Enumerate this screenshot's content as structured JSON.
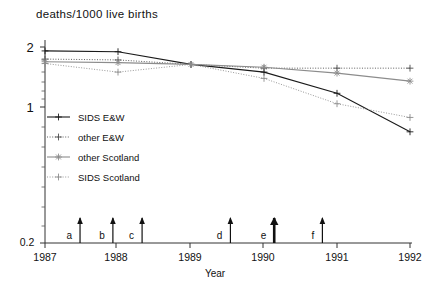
{
  "chart_data": {
    "type": "line",
    "title": "deaths/1000 live births",
    "xlabel": "Year",
    "ylabel": "",
    "yscale": "log",
    "ylim": [
      0.2,
      2.4
    ],
    "xlim": [
      1987,
      1992
    ],
    "ytick_labels": [
      "2",
      "1",
      "0.2"
    ],
    "ytick_values": [
      2,
      1,
      0.2
    ],
    "xtick_labels": [
      "1987",
      "1988",
      "1989",
      "1990",
      "1991",
      "1992"
    ],
    "xtick_values": [
      1987,
      1988,
      1989,
      1990,
      1991,
      1992
    ],
    "grid": false,
    "legend_position": "center-left",
    "x": [
      1987,
      1988,
      1989,
      1990,
      1991,
      1992
    ],
    "series": [
      {
        "name": "SIDS E&W",
        "color": "#1a1a1a",
        "linestyle": "solid",
        "marker": "plus",
        "values": [
          2.1,
          2.08,
          1.78,
          1.62,
          1.25,
          0.78
        ]
      },
      {
        "name": "other E&W",
        "color": "#4d4d4d",
        "linestyle": "dotted",
        "marker": "plus",
        "values": [
          1.9,
          1.88,
          1.78,
          1.7,
          1.7,
          1.7
        ]
      },
      {
        "name": "other Scotland",
        "color": "#8c8c8c",
        "linestyle": "solid",
        "marker": "asterisk",
        "values": [
          1.84,
          1.82,
          1.78,
          1.72,
          1.6,
          1.45
        ]
      },
      {
        "name": "SIDS Scotland",
        "color": "#8c8c8c",
        "linestyle": "dotted",
        "marker": "plus",
        "values": [
          1.8,
          1.62,
          1.78,
          1.5,
          1.1,
          0.93
        ]
      }
    ],
    "annotations": [
      {
        "label": "a",
        "x": 1987.48,
        "emphasis": "normal"
      },
      {
        "label": "b",
        "x": 1987.93,
        "emphasis": "normal"
      },
      {
        "label": "c",
        "x": 1988.33,
        "emphasis": "normal"
      },
      {
        "label": "d",
        "x": 1989.54,
        "emphasis": "normal"
      },
      {
        "label": "e",
        "x": 1990.14,
        "emphasis": "bold"
      },
      {
        "label": "f",
        "x": 1990.8,
        "emphasis": "normal"
      }
    ]
  },
  "legend": {
    "items": [
      {
        "label": "SIDS E&W"
      },
      {
        "label": "other E&W"
      },
      {
        "label": "other Scotland"
      },
      {
        "label": "SIDS Scotland"
      }
    ]
  },
  "axis": {
    "x_axis_name": "Year",
    "title": "deaths/1000 live births"
  }
}
